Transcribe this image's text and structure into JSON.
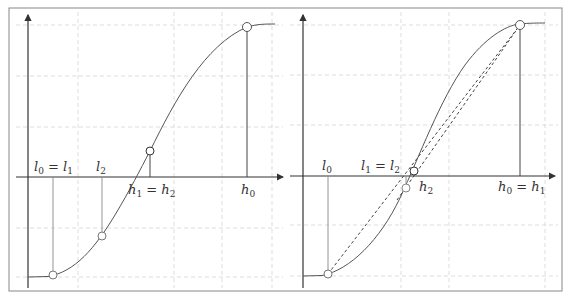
{
  "figure": {
    "panels": [
      {
        "id": "left",
        "labels": {
          "l0_eq_l1": {
            "main": "l",
            "sub1": "0",
            "eq": " = ",
            "main2": "l",
            "sub2": "1"
          },
          "l2": {
            "main": "l",
            "sub": "2"
          },
          "h1_eq_h2": {
            "main": "h",
            "sub1": "1",
            "eq": " = ",
            "main2": "h",
            "sub2": "2"
          },
          "h0": {
            "main": "h",
            "sub": "0"
          }
        }
      },
      {
        "id": "right",
        "labels": {
          "l0": {
            "main": "l",
            "sub": "0"
          },
          "l1_eq_l2": {
            "main": "l",
            "sub1": "1",
            "eq": " = ",
            "main2": "l",
            "sub2": "2"
          },
          "h2": {
            "main": "h",
            "sub": "2"
          },
          "h0_eq_h1": {
            "main": "h",
            "sub1": "0",
            "eq": " = ",
            "main2": "h",
            "sub2": "1"
          }
        }
      }
    ],
    "colors": {
      "curve": "#555555",
      "axis": "#333333",
      "grid": "#cccccc",
      "frame": "#888888"
    }
  }
}
